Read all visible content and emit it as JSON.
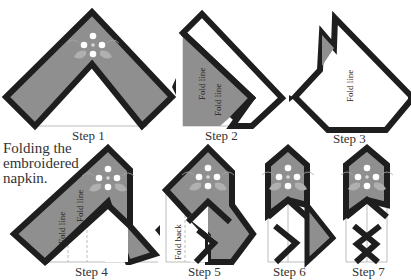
{
  "title": {
    "lines": [
      "Folding the",
      "embroidered",
      "napkin."
    ]
  },
  "steps": [
    {
      "label": "Step 1"
    },
    {
      "label": "Step 2",
      "annotations": [
        "Fold line",
        "Fold line"
      ]
    },
    {
      "label": "Step 3",
      "annotations": [
        "Fold line"
      ]
    },
    {
      "label": "Step 4",
      "annotations": [
        "Fold line",
        "Fold line"
      ]
    },
    {
      "label": "Step 5",
      "annotations": [
        "Fold back"
      ]
    },
    {
      "label": "Step 6"
    },
    {
      "label": "Step 7"
    }
  ],
  "colors": {
    "fabric": "#8f8f8f",
    "border": "#1e1e1e",
    "guide": "#bdbdbd",
    "embroidery_light": "#ffffff",
    "embroidery_leaf": "#b4b4b4"
  }
}
